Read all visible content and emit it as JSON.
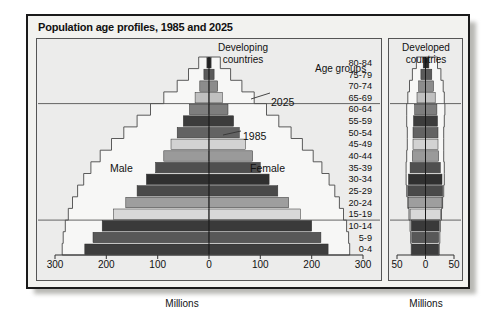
{
  "figure": {
    "title": "Population age profiles, 1985 and 2025"
  },
  "panels": {
    "left": {
      "heading": "Developing\ncountries",
      "axis_title": "Millions",
      "ticks": [
        "300",
        "200",
        "100",
        "0",
        "100",
        "200",
        "300"
      ],
      "male_label": "Male",
      "female_label": "Female"
    },
    "right": {
      "heading": "Developed\ncountries",
      "axis_title": "Millions",
      "ticks": [
        "50",
        "0",
        "50"
      ]
    }
  },
  "annotations": {
    "age_groups_title": "Age groups",
    "year_2025": "2025",
    "year_1985": "1985"
  },
  "colors": {
    "frame": "#1a1a1a",
    "plot_background": "#ececeb",
    "outline_2025": "#ffffff",
    "axis": "#333333"
  },
  "chart_data": {
    "type": "bar",
    "title": "Population age profiles, 1985 and 2025",
    "xlabel": "Millions",
    "ylabel": "Age groups",
    "orientation": "horizontal-population-pyramid",
    "categories": [
      "0-4",
      "5-9",
      "10-14",
      "15-19",
      "20-24",
      "25-29",
      "30-34",
      "35-39",
      "40-44",
      "45-49",
      "50-54",
      "55-59",
      "60-64",
      "65-69",
      "70-74",
      "75-79",
      "80-84"
    ],
    "panels": [
      {
        "name": "Developing countries",
        "xlim": [
          -300,
          300
        ],
        "xticks": [
          -300,
          -200,
          -100,
          0,
          100,
          200,
          300
        ],
        "series": [
          {
            "name": "1985 Male",
            "year": 1985,
            "sex": "Male",
            "values": [
              -242,
              -226,
              -208,
              -186,
              -162,
              -140,
              -122,
              -104,
              -88,
              -74,
              -62,
              -50,
              -38,
              -27,
              -18,
              -10,
              -4
            ]
          },
          {
            "name": "1985 Female",
            "year": 1985,
            "sex": "Female",
            "values": [
              232,
              218,
              200,
              178,
              155,
              134,
              117,
              100,
              85,
              71,
              59,
              48,
              37,
              26,
              17,
              10,
              4
            ]
          },
          {
            "name": "2025 Male",
            "year": 2025,
            "sex": "Male",
            "values": [
              -286,
              -284,
              -280,
              -274,
              -266,
              -256,
              -244,
              -230,
              -212,
              -190,
              -166,
              -140,
              -114,
              -88,
              -62,
              -40,
              -20
            ]
          },
          {
            "name": "2025 Female",
            "year": 2025,
            "sex": "Female",
            "values": [
              274,
              272,
              268,
              262,
              254,
              245,
              234,
              220,
              203,
              182,
              160,
              136,
              112,
              88,
              64,
              42,
              22
            ]
          }
        ]
      },
      {
        "name": "Developed countries",
        "xlim": [
          -50,
          50
        ],
        "xticks": [
          -50,
          0,
          50
        ],
        "series": [
          {
            "name": "1985 Male",
            "year": 1985,
            "sex": "Male",
            "values": [
              -24,
              -24,
              -25,
              -27,
              -30,
              -31,
              -30,
              -27,
              -23,
              -22,
              -22,
              -21,
              -19,
              -15,
              -12,
              -8,
              -4
            ]
          },
          {
            "name": "1985 Female",
            "year": 1985,
            "sex": "Female",
            "values": [
              23,
              23,
              24,
              26,
              29,
              30,
              29,
              26,
              23,
              22,
              22,
              21,
              20,
              17,
              14,
              11,
              6
            ]
          },
          {
            "name": "2025 Male",
            "year": 2025,
            "sex": "Male",
            "values": [
              -25,
              -26,
              -27,
              -29,
              -31,
              -33,
              -34,
              -34,
              -33,
              -32,
              -32,
              -33,
              -33,
              -31,
              -28,
              -23,
              -16
            ]
          },
          {
            "name": "2025 Female",
            "year": 2025,
            "sex": "Female",
            "values": [
              24,
              25,
              26,
              28,
              30,
              32,
              33,
              33,
              32,
              32,
              32,
              33,
              34,
              33,
              31,
              27,
              21
            ]
          }
        ]
      }
    ],
    "band_shades": [
      "#3d3d3d",
      "#585858",
      "#3a3a3a",
      "#d8d8d8",
      "#9e9e9e",
      "#4a4a4a",
      "#303030",
      "#4f4f4f",
      "#9a9a9a",
      "#d2d2d2",
      "#636363",
      "#3c3c3c",
      "#7e7e7e",
      "#c0c0c0",
      "#8c8c8c",
      "#5a5a5a",
      "#2b2b2b"
    ],
    "reference_lines": [
      65,
      15
    ],
    "grid": false,
    "legend_position": "inline-annotations"
  }
}
